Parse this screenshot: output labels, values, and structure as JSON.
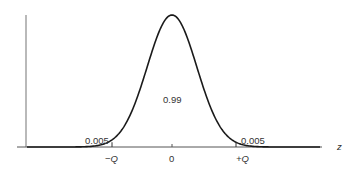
{
  "chart_data": {
    "type": "line",
    "title": "",
    "xlabel": "z",
    "ylabel": "",
    "distribution": "standard normal",
    "x_ticks": [
      "−Q",
      "0",
      "+Q"
    ],
    "x_axis_label": "z",
    "regions": [
      {
        "name": "left-tail",
        "label": "0.005",
        "range": [
          "-inf",
          "-Q"
        ]
      },
      {
        "name": "center",
        "label": "0.99",
        "range": [
          "-Q",
          "+Q"
        ]
      },
      {
        "name": "right-tail",
        "label": "0.005",
        "range": [
          "+Q",
          "+inf"
        ]
      }
    ],
    "critical_value_Q": 2.576,
    "grid": false,
    "legend": null
  },
  "labels": {
    "left_tail": "0.005",
    "center": "0.99",
    "right_tail": "0.005",
    "tick_neg_q": "−Q",
    "tick_zero": "0",
    "tick_pos_q": "+Q",
    "x_axis": "z"
  },
  "colors": {
    "curve": "#1a1a1a",
    "axis": "#555555",
    "text": "#333333"
  }
}
